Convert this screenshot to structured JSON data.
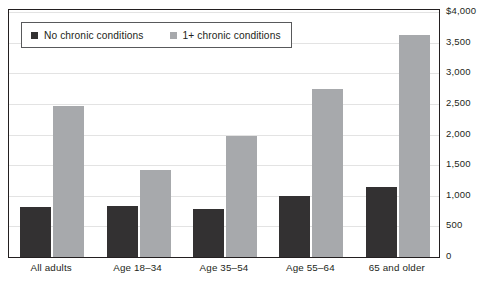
{
  "top_clipped_text": "",
  "legend": {
    "position": "top-left-inside",
    "items": [
      {
        "label": "No chronic conditions",
        "color": "#333132",
        "swatch": "square-swatch"
      },
      {
        "label": "1+ chronic conditions",
        "color": "#a7a9ac",
        "swatch": "square-swatch"
      }
    ]
  },
  "axes": {
    "y_ticks": [
      "$4,000",
      "3,500",
      "3,000",
      "2,500",
      "2,000",
      "1,500",
      "1,000",
      "500",
      "0"
    ],
    "x_ticks": [
      "All adults",
      "Age 18–34",
      "Age 35–54",
      "Age 55–64",
      "65 and older"
    ]
  },
  "chart_data": {
    "type": "bar",
    "title": "",
    "subtitle": "",
    "xlabel": "",
    "ylabel": "",
    "categories": [
      "All adults",
      "Age 18–34",
      "Age 35–54",
      "Age 55–64",
      "65 and older"
    ],
    "series": [
      {
        "name": "No chronic conditions",
        "color": "#333132",
        "values": [
          820,
          830,
          780,
          1000,
          1150
        ]
      },
      {
        "name": "1+ chronic conditions",
        "color": "#a7a9ac",
        "values": [
          2470,
          1420,
          1980,
          2740,
          3620
        ]
      }
    ],
    "ylim": [
      0,
      4000
    ],
    "ytick_values": [
      0,
      500,
      1000,
      1500,
      2000,
      2500,
      3000,
      3500,
      4000
    ],
    "ytick_labels": [
      "0",
      "500",
      "1,000",
      "1,500",
      "2,000",
      "2,500",
      "3,000",
      "3,500",
      "$4,000"
    ],
    "grid": true,
    "grid_axis": "y",
    "legend_position": "upper left",
    "units": "dollars"
  }
}
